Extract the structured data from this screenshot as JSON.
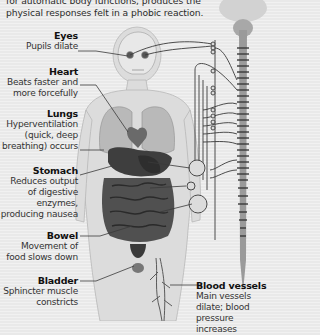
{
  "intro": {
    "line1": "for automatic body functions, produces the",
    "line2": "physical responses felt in a phobic reaction."
  },
  "labels": [
    {
      "id": "eyes",
      "title": "Eyes",
      "lines": [
        "Pupils dilate"
      ]
    },
    {
      "id": "heart",
      "title": "Heart",
      "lines": [
        "Beats faster and",
        "more forcefully"
      ]
    },
    {
      "id": "lungs",
      "title": "Lungs",
      "lines": [
        "Hyperventilation",
        "(quick, deep",
        "breathing) occurs"
      ]
    },
    {
      "id": "stomach",
      "title": "Stomach",
      "lines": [
        "Reduces output",
        "of digestive",
        "enzymes,",
        "producing nausea"
      ]
    },
    {
      "id": "bowel",
      "title": "Bowel",
      "lines": [
        "Movement of",
        "food slows down"
      ]
    },
    {
      "id": "bladder",
      "title": "Bladder",
      "lines": [
        "Sphincter muscle",
        "constricts"
      ]
    },
    {
      "id": "blood_vessels",
      "title": "Blood vessels",
      "lines": [
        "Main vessels",
        "dilate; blood",
        "pressure increases"
      ]
    }
  ],
  "colors": {
    "background": "#e9e9e9",
    "body": "#d9d9d9",
    "organs": "#4a4a4a",
    "spine": "#8a8a8a",
    "lines": "#3a3a3a"
  }
}
